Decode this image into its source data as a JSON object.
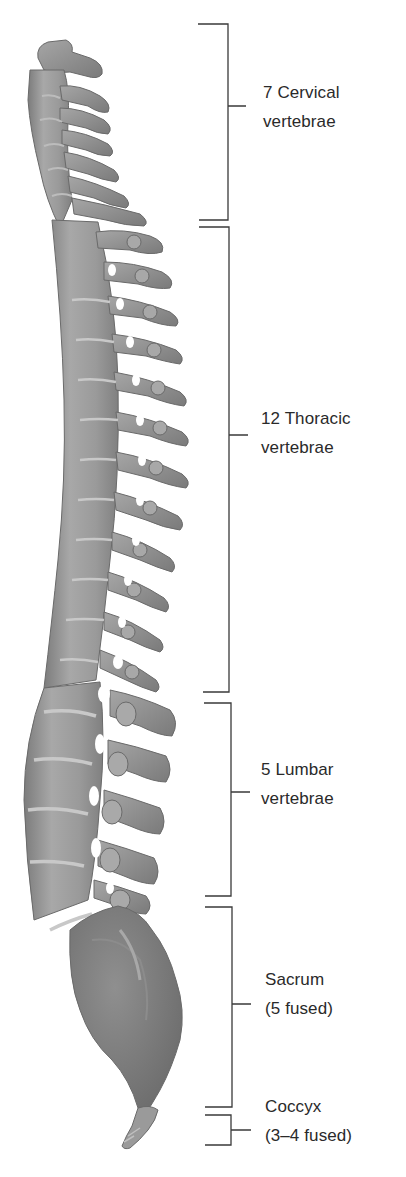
{
  "figure": {
    "colors": {
      "bone_fill": "#9a9a9a",
      "bone_light": "#bdbdbd",
      "bone_dark": "#6e6e6e",
      "bracket_line": "#3a3a3a",
      "text": "#2a2a2a",
      "background": "#ffffff"
    }
  },
  "regions": [
    {
      "id": "cervical",
      "line1": "7 Cervical",
      "line2": "vertebrae",
      "count": 7,
      "bracket": {
        "top": 24,
        "bottom": 220,
        "x": 229,
        "tick_y": 106
      }
    },
    {
      "id": "thoracic",
      "line1": "12 Thoracic",
      "line2": "vertebrae",
      "count": 12,
      "bracket": {
        "top": 227,
        "bottom": 692,
        "x": 231,
        "tick_y": 435
      }
    },
    {
      "id": "lumbar",
      "line1": "5 Lumbar",
      "line2": "vertebrae",
      "count": 5,
      "bracket": {
        "top": 703,
        "bottom": 896,
        "x": 232,
        "tick_y": 792
      }
    },
    {
      "id": "sacrum",
      "line1": "Sacrum",
      "line2": "(5 fused)",
      "count": 5,
      "bracket": {
        "top": 907,
        "bottom": 1107,
        "x": 233,
        "tick_y": 1004
      }
    },
    {
      "id": "coccyx",
      "line1": "Coccyx",
      "line2": "(3–4 fused)",
      "count": "3–4",
      "bracket": {
        "top": 1115,
        "bottom": 1145,
        "x": 232,
        "tick_y": 1130
      }
    }
  ]
}
